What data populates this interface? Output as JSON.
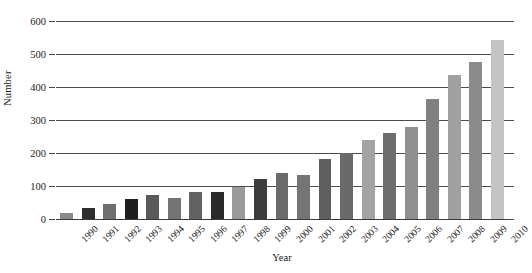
{
  "chart_data": {
    "type": "bar",
    "title": "",
    "xlabel": "Year",
    "ylabel": "Number",
    "categories": [
      "1990",
      "1991",
      "1992",
      "1993",
      "1994",
      "1995",
      "1996",
      "1997",
      "1998",
      "1999",
      "2000",
      "2001",
      "2002",
      "2003",
      "2004",
      "2005",
      "2006",
      "2007",
      "2008",
      "2009",
      "2010"
    ],
    "values": [
      18,
      33,
      45,
      62,
      72,
      63,
      82,
      83,
      96,
      120,
      140,
      132,
      182,
      200,
      240,
      260,
      280,
      364,
      437,
      476,
      542
    ],
    "series": [
      {
        "name": "Number",
        "values": [
          18,
          33,
          45,
          62,
          72,
          63,
          82,
          83,
          96,
          120,
          140,
          132,
          182,
          200,
          240,
          260,
          280,
          364,
          437,
          476,
          542
        ]
      }
    ],
    "ylim": [
      0,
      600
    ],
    "yticks": [
      0,
      100,
      200,
      300,
      400,
      500,
      600
    ],
    "ytick_labels": [
      "0",
      "100",
      "200",
      "300",
      "400",
      "500",
      "600"
    ],
    "grid": true,
    "grid_axis": "y",
    "legend": "none",
    "bar_colors": [
      "#8a8a8a",
      "#2e2e2e",
      "#6f6f6f",
      "#1f1f1f",
      "#5a5a5a",
      "#747474",
      "#636363",
      "#2b2b2b",
      "#9a9a9a",
      "#3c3c3c",
      "#6b6b6b",
      "#757575",
      "#5e5e5e",
      "#6a6a6a",
      "#a3a3a3",
      "#6d6d6d",
      "#8f8f8f",
      "#808080",
      "#a0a0a0",
      "#8b8b8b",
      "#c4c4c4"
    ]
  },
  "axes": {
    "y_title": "Number",
    "x_title": "Year"
  }
}
